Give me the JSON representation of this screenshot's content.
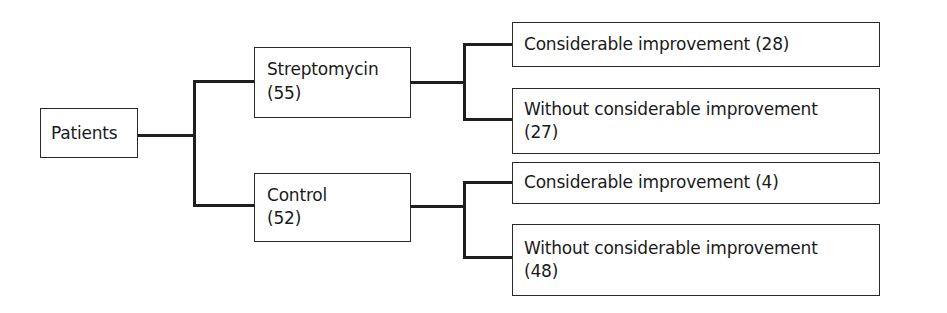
{
  "diagram": {
    "type": "tree",
    "root": {
      "label": "Patients"
    },
    "groups": [
      {
        "name": "Streptomycin",
        "count": "(55)",
        "outcomes": [
          {
            "label": "Considerable improvement (28)"
          },
          {
            "label_line1": "Without considerable improvement",
            "label_line2": "(27)"
          }
        ]
      },
      {
        "name": "Control",
        "count": "(52)",
        "outcomes": [
          {
            "label": "Considerable improvement (4)"
          },
          {
            "label_line1": "Without considerable improvement",
            "label_line2": "(48)"
          }
        ]
      }
    ],
    "colors": {
      "line": "#1e1e1e",
      "border": "#2a2a2a",
      "text": "#1a1a1a",
      "background": "#ffffff"
    }
  }
}
